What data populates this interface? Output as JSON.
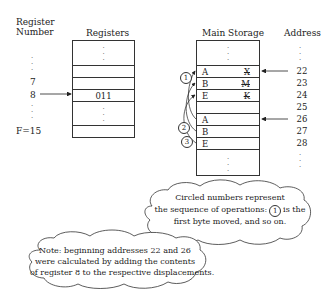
{
  "register_panel": {
    "column_header_line1": "Register",
    "column_header_line2": "Number",
    "registers_header": "Registers",
    "register_labels": [
      "7",
      "8",
      "F=15"
    ],
    "selected_register": "8",
    "selected_register_value": "011"
  },
  "storage_panel": {
    "header": "Main Storage",
    "address_header": "Address",
    "rows": [
      {
        "left": "A",
        "right": "X",
        "right_struck": true,
        "address": "22",
        "pointer": true
      },
      {
        "left": "B",
        "right": "M",
        "right_struck": true,
        "address": "23",
        "pointer": false
      },
      {
        "left": "E",
        "right": "K",
        "right_struck": true,
        "address": "24",
        "pointer": false
      },
      {
        "left": "",
        "right": "",
        "right_struck": false,
        "address": "25",
        "pointer": false
      },
      {
        "left": "A",
        "right": "",
        "right_struck": false,
        "address": "26",
        "pointer": true
      },
      {
        "left": "B",
        "right": "",
        "right_struck": false,
        "address": "27",
        "pointer": false
      },
      {
        "left": "E",
        "right": "",
        "right_struck": false,
        "address": "28",
        "pointer": false
      }
    ],
    "operation_markers": [
      "1",
      "2",
      "3"
    ]
  },
  "notes": {
    "sequence_note": {
      "line1": "Circled numbers represent",
      "line2_before": "the sequence of operations:",
      "line2_marker": "1",
      "line2_after": "is the",
      "line3": "first byte moved, and so on."
    },
    "address_note": {
      "line1": "Note: beginning addresses 22 and 26",
      "line2": "were calculated by adding the contents",
      "line3": "of register 8 to the respective displacements."
    }
  }
}
